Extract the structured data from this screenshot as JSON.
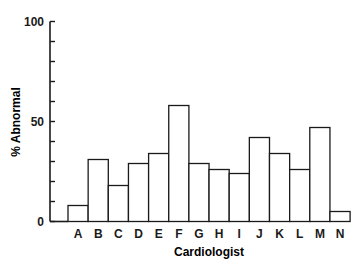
{
  "chart_data": {
    "type": "bar",
    "title": "",
    "xlabel": "Cardiologist",
    "ylabel": "% Abnormal",
    "ylim": [
      0,
      100
    ],
    "yticks_labeled": [
      0,
      50,
      100
    ],
    "yticks_minor_step": 10,
    "grid": false,
    "categories": [
      "A",
      "B",
      "C",
      "D",
      "E",
      "F",
      "G",
      "H",
      "I",
      "J",
      "K",
      "L",
      "M",
      "N"
    ],
    "values": [
      8,
      31,
      18,
      29,
      34,
      58,
      29,
      26,
      24,
      42,
      34,
      26,
      47,
      5
    ]
  },
  "style": {
    "bar_fill": "#ffffff",
    "bar_stroke": "#1a1a1a",
    "axis_color": "#1a1a1a"
  }
}
